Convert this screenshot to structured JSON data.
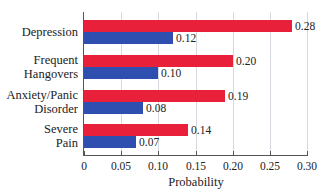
{
  "chart_data": {
    "type": "bar",
    "orientation": "horizontal",
    "title": "",
    "xlabel": "Probability",
    "ylabel": "",
    "xlim": [
      0,
      0.3
    ],
    "xticks": [
      "0",
      "0.05",
      "0.10",
      "0.15",
      "0.20",
      "0.25",
      "0.30"
    ],
    "grid": true,
    "legend": "none",
    "categories": [
      "Depression",
      "Frequent\nHangovers",
      "Anxiety/Panic\nDisorder",
      "Severe\nPain"
    ],
    "series": [
      {
        "name": "red series",
        "color": "#e8203a",
        "values": [
          0.28,
          0.2,
          0.19,
          0.14
        ],
        "labels": [
          "0.28",
          "0.20",
          "0.19",
          "0.14"
        ]
      },
      {
        "name": "blue series",
        "color": "#2f4fb0",
        "values": [
          0.12,
          0.1,
          0.08,
          0.07
        ],
        "labels": [
          "0.12",
          "0.10",
          "0.08",
          "0.07"
        ]
      }
    ]
  }
}
